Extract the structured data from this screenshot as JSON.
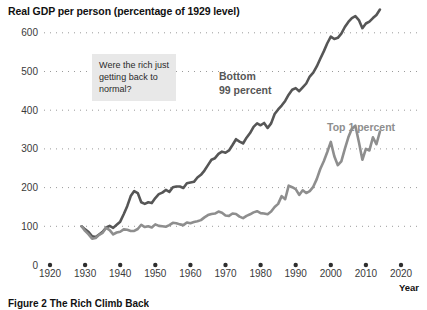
{
  "chart_data": {
    "type": "line",
    "title": "Real GDP per person (percentage of 1929 level)",
    "xlabel": "Year",
    "ylabel": "",
    "xlim": [
      1917,
      2022
    ],
    "ylim": [
      0,
      620
    ],
    "yticks": [
      0,
      100,
      200,
      300,
      400,
      500,
      600
    ],
    "xticks": [
      1920,
      1930,
      1940,
      1950,
      1960,
      1970,
      1980,
      1990,
      2000,
      2010,
      2020
    ],
    "grid": "dotted-horizontal",
    "legend": "inline-annotations",
    "annotations": [
      {
        "name": "callout-note",
        "text": "Were the rich just getting back to normal?",
        "x": 1932,
        "y": 520
      },
      {
        "name": "bottom-99-label",
        "text": "Bottom\n99 percent",
        "color": "#4d4d4d"
      },
      {
        "name": "top-1-label",
        "text": "Top 1 percent",
        "color": "#8a8a8a"
      }
    ],
    "series": [
      {
        "name": "Bottom 99 percent",
        "label_line1": "Bottom",
        "label_line2": "99 percent",
        "color": "#565656",
        "x": [
          1929,
          1930,
          1931,
          1932,
          1933,
          1934,
          1935,
          1936,
          1937,
          1938,
          1939,
          1940,
          1941,
          1942,
          1943,
          1944,
          1945,
          1946,
          1947,
          1948,
          1949,
          1950,
          1951,
          1952,
          1953,
          1954,
          1955,
          1956,
          1957,
          1958,
          1959,
          1960,
          1961,
          1962,
          1963,
          1964,
          1965,
          1966,
          1967,
          1968,
          1969,
          1970,
          1971,
          1972,
          1973,
          1974,
          1975,
          1976,
          1977,
          1978,
          1979,
          1980,
          1981,
          1982,
          1983,
          1984,
          1985,
          1986,
          1987,
          1988,
          1989,
          1990,
          1991,
          1992,
          1993,
          1994,
          1995,
          1996,
          1997,
          1998,
          1999,
          2000,
          2001,
          2002,
          2003,
          2004,
          2005,
          2006,
          2007,
          2008,
          2009,
          2010,
          2011,
          2012,
          2013,
          2014
        ],
        "values": [
          100,
          92,
          85,
          74,
          72,
          79,
          86,
          97,
          101,
          96,
          104,
          112,
          131,
          152,
          178,
          191,
          186,
          162,
          158,
          162,
          160,
          173,
          183,
          187,
          194,
          189,
          201,
          203,
          203,
          199,
          211,
          213,
          215,
          226,
          233,
          244,
          258,
          272,
          276,
          287,
          293,
          290,
          296,
          310,
          325,
          319,
          314,
          329,
          341,
          357,
          366,
          361,
          367,
          354,
          366,
          390,
          402,
          412,
          424,
          440,
          453,
          457,
          449,
          459,
          469,
          487,
          497,
          513,
          533,
          552,
          573,
          590,
          584,
          587,
          598,
          615,
          628,
          638,
          643,
          633,
          612,
          624,
          629,
          638,
          646,
          660
        ]
      },
      {
        "name": "Top 1 percent",
        "label": "Top 1 percent",
        "color": "#8e8e8e",
        "x": [
          1929,
          1930,
          1931,
          1932,
          1933,
          1934,
          1935,
          1936,
          1937,
          1938,
          1939,
          1940,
          1941,
          1942,
          1943,
          1944,
          1945,
          1946,
          1947,
          1948,
          1949,
          1950,
          1951,
          1952,
          1953,
          1954,
          1955,
          1956,
          1957,
          1958,
          1959,
          1960,
          1961,
          1962,
          1963,
          1964,
          1965,
          1966,
          1967,
          1968,
          1969,
          1970,
          1971,
          1972,
          1973,
          1974,
          1975,
          1976,
          1977,
          1978,
          1979,
          1980,
          1981,
          1982,
          1983,
          1984,
          1985,
          1986,
          1987,
          1988,
          1989,
          1990,
          1991,
          1992,
          1993,
          1994,
          1995,
          1996,
          1997,
          1998,
          1999,
          2000,
          2001,
          2002,
          2003,
          2004,
          2005,
          2006,
          2007,
          2008,
          2009,
          2010,
          2011,
          2012,
          2013,
          2014
        ],
        "values": [
          100,
          88,
          79,
          68,
          70,
          78,
          83,
          96,
          90,
          79,
          84,
          86,
          92,
          91,
          88,
          88,
          93,
          104,
          98,
          100,
          97,
          105,
          101,
          100,
          99,
          103,
          109,
          108,
          105,
          103,
          110,
          108,
          111,
          113,
          116,
          123,
          129,
          132,
          133,
          138,
          135,
          128,
          127,
          133,
          132,
          125,
          121,
          127,
          131,
          136,
          139,
          134,
          133,
          131,
          138,
          150,
          158,
          178,
          170,
          205,
          201,
          196,
          181,
          193,
          186,
          191,
          202,
          222,
          248,
          268,
          292,
          318,
          281,
          258,
          268,
          300,
          330,
          352,
          360,
          318,
          272,
          300,
          296,
          330,
          312,
          345
        ]
      }
    ]
  },
  "caption": {
    "text": "Figure 2 The Rich Climb Back"
  },
  "axis": {
    "year_title": "Year"
  }
}
